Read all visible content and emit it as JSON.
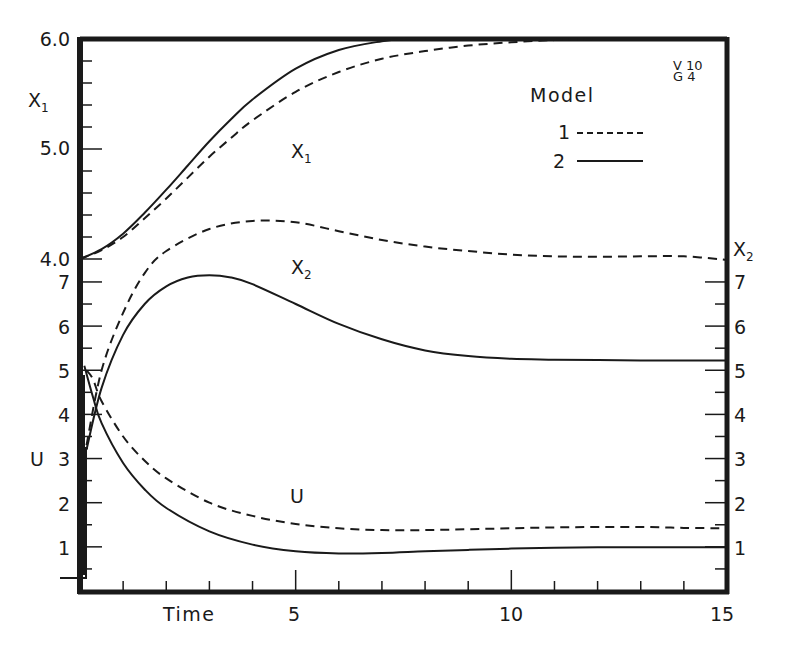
{
  "chart_data": {
    "type": "line",
    "title": "",
    "xlabel": "Time",
    "xlim": [
      0,
      15
    ],
    "x_ticks": [
      5,
      10,
      15
    ],
    "x_minor_step": 1,
    "panels": [
      {
        "name": "X1",
        "ylabel": "X1",
        "ylim": [
          4.0,
          6.0
        ],
        "y_ticks": [
          "4.0",
          "5.0",
          "6.0"
        ],
        "y_minor_step": 0.2,
        "axis_side": "left"
      },
      {
        "name": "X2 / U",
        "ylabel_left": "U",
        "ylabel_right": "X2",
        "ylim": [
          0,
          7
        ],
        "y_ticks": [
          "1",
          "2",
          "3",
          "4",
          "5",
          "6",
          "7"
        ],
        "y_minor_step": 0.5,
        "axis_side": "both"
      }
    ],
    "legend": {
      "title": "Model",
      "position": "upper right",
      "entries": [
        {
          "label": "1",
          "style": "dashed"
        },
        {
          "label": "2",
          "style": "solid"
        }
      ]
    },
    "annotations": [
      "V 10",
      "G 4"
    ],
    "grid": false,
    "series": [
      {
        "name": "X1 Model 1",
        "variable": "X1",
        "model": "1",
        "style": "dashed",
        "axis": "X1",
        "x": [
          0,
          0.5,
          1,
          1.5,
          2,
          2.5,
          3,
          3.5,
          4,
          5,
          6,
          7,
          8,
          9,
          10,
          11,
          12
        ],
        "y": [
          4.0,
          4.08,
          4.2,
          4.37,
          4.55,
          4.74,
          4.93,
          5.1,
          5.26,
          5.52,
          5.7,
          5.82,
          5.89,
          5.94,
          5.97,
          5.99,
          6.0
        ]
      },
      {
        "name": "X1 Model 2",
        "variable": "X1",
        "model": "2",
        "style": "solid",
        "axis": "X1",
        "x": [
          0,
          0.5,
          1,
          1.5,
          2,
          2.5,
          3,
          3.5,
          4,
          5,
          6,
          7,
          7.5,
          8
        ],
        "y": [
          4.0,
          4.09,
          4.23,
          4.42,
          4.63,
          4.85,
          5.07,
          5.27,
          5.45,
          5.73,
          5.9,
          5.98,
          6.0,
          6.0
        ]
      },
      {
        "name": "X2 Model 1",
        "variable": "X2",
        "model": "1",
        "style": "dashed",
        "axis": "X2",
        "x": [
          0.15,
          0.5,
          1,
          1.5,
          2,
          3,
          4,
          5,
          6,
          7,
          8,
          9,
          10,
          11,
          12,
          13,
          14,
          15
        ],
        "y": [
          3.3,
          5.0,
          6.3,
          7.2,
          7.7,
          8.2,
          8.38,
          8.35,
          8.15,
          7.95,
          7.8,
          7.7,
          7.62,
          7.58,
          7.57,
          7.58,
          7.58,
          7.5
        ]
      },
      {
        "name": "X2 Model 2",
        "variable": "X2",
        "model": "2",
        "style": "solid",
        "axis": "X2",
        "x": [
          0.15,
          0.5,
          1,
          1.5,
          2,
          2.5,
          3,
          3.5,
          4,
          5,
          6,
          7,
          8,
          9,
          10,
          11,
          12,
          13,
          14,
          15
        ],
        "y": [
          3.2,
          4.6,
          5.8,
          6.5,
          6.9,
          7.1,
          7.15,
          7.1,
          6.95,
          6.5,
          6.05,
          5.7,
          5.45,
          5.32,
          5.26,
          5.24,
          5.23,
          5.22,
          5.22,
          5.22
        ]
      },
      {
        "name": "U Model 1",
        "variable": "U",
        "model": "1",
        "style": "dashed",
        "axis": "U",
        "x": [
          0.15,
          0.3,
          0.5,
          1,
          1.5,
          2,
          3,
          4,
          5,
          6,
          7,
          8,
          9,
          10,
          11,
          12,
          13,
          14,
          15
        ],
        "y": [
          5.0,
          4.8,
          4.3,
          3.5,
          2.95,
          2.55,
          2.0,
          1.7,
          1.52,
          1.42,
          1.38,
          1.38,
          1.4,
          1.42,
          1.44,
          1.45,
          1.45,
          1.43,
          1.42
        ]
      },
      {
        "name": "U Model 2",
        "variable": "U",
        "model": "2",
        "style": "solid",
        "axis": "U",
        "x": [
          0.1,
          0.3,
          0.5,
          1,
          1.5,
          2,
          3,
          4,
          5,
          6,
          7,
          8,
          9,
          10,
          11,
          12,
          13,
          14,
          15
        ],
        "y": [
          5.1,
          4.4,
          3.8,
          2.9,
          2.3,
          1.88,
          1.35,
          1.05,
          0.9,
          0.85,
          0.86,
          0.9,
          0.93,
          0.96,
          0.98,
          0.99,
          0.99,
          0.99,
          0.99
        ]
      }
    ]
  },
  "labels": {
    "x_axis_title": "Time",
    "x_tick_5": "5",
    "x_tick_10": "10",
    "x_tick_15": "15",
    "x1_axis_main": "X",
    "x1_axis_sub": "1",
    "u_axis": "U",
    "x2_axis_main": "X",
    "x2_axis_sub": "2",
    "x1_tick_60": "6.0",
    "x1_tick_50": "5.0",
    "x1_tick_40": "4.0",
    "left_tick_7": "7",
    "left_tick_6": "6",
    "left_tick_5": "5",
    "left_tick_4": "4",
    "left_tick_3": "3",
    "left_tick_2": "2",
    "left_tick_1": "1",
    "right_tick_7": "7",
    "right_tick_6": "6",
    "right_tick_5": "5",
    "right_tick_4": "4",
    "right_tick_3": "3",
    "right_tick_2": "2",
    "right_tick_1": "1",
    "curve_x1_main": "X",
    "curve_x1_sub": "1",
    "curve_x2_main": "X",
    "curve_x2_sub": "2",
    "curve_u": "U",
    "legend_title": "Model",
    "legend_1": "1",
    "legend_2": "2",
    "code_v": "V 10",
    "code_g": "G 4"
  },
  "style": {
    "ink": "#1a1a1a",
    "background": "#ffffff"
  }
}
